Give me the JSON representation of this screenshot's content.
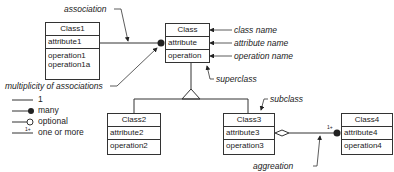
{
  "classes": {
    "class1": {
      "name": "Class1",
      "attribute": "attribute1",
      "operations": [
        "operation1",
        "operation1a"
      ]
    },
    "class": {
      "name": "Class",
      "attribute": "attribute",
      "operation": "operation"
    },
    "class2": {
      "name": "Class2",
      "attribute": "attribute2",
      "operation": "operation2"
    },
    "class3": {
      "name": "Class3",
      "attribute": "attribute3",
      "operation": "operation3"
    },
    "class4": {
      "name": "Class4",
      "attribute": "attribute4",
      "operation": "operation4"
    }
  },
  "annotations": {
    "association": "association",
    "multiplicity": "multiplicity of associations",
    "class_name": "class name",
    "attribute_name": "attribute name",
    "operation_name": "operation name",
    "superclass": "superclass",
    "subclass": "subclass",
    "aggregation": "aggreation",
    "one_or_more_mark": "1+"
  },
  "legend": {
    "items": [
      {
        "symbol": "line",
        "label": "1"
      },
      {
        "symbol": "filled-circle",
        "label": "many"
      },
      {
        "symbol": "open-circle",
        "label": "optional"
      },
      {
        "symbol": "1+",
        "label": "one or more"
      }
    ]
  }
}
